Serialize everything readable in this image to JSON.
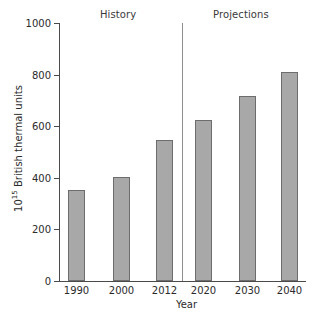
{
  "chart_data": {
    "type": "bar",
    "title": "",
    "categories": [
      "1990",
      "2000",
      "2012",
      "2020",
      "2030",
      "2040"
    ],
    "values": [
      353,
      403,
      547,
      624,
      717,
      810
    ],
    "xlabel": "Year",
    "ylabel": "10^15 British thermal units",
    "ylabel_base": "10",
    "ylabel_exponent": "15",
    "ylabel_rest": " British thermal units",
    "ylim": [
      0,
      1000
    ],
    "ytick_values": [
      1000,
      800,
      600,
      400,
      200,
      0
    ],
    "ytick_labels": [
      "1000",
      "800",
      "600",
      "400",
      "200",
      "0"
    ],
    "grid": false,
    "legend": "none",
    "bar_color": "#a8a8a8",
    "bar_border_color": "#6d6d6d",
    "axis_color": "#4a4a4a",
    "divider_color": "#8e8e8e",
    "annotations": [
      {
        "text": "History",
        "region": "left-of-divider"
      },
      {
        "text": "Projections",
        "region": "right-of-divider"
      }
    ],
    "divider_between": [
      "2012",
      "2020"
    ]
  },
  "sections": {
    "history_label": "History",
    "projections_label": "Projections"
  }
}
